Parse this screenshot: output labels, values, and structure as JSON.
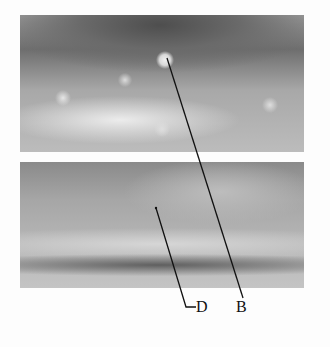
{
  "figure": {
    "type": "technical-manual-illustration",
    "panels": [
      {
        "id": "top",
        "description": "Close-up of wheel rim / drum interior showing bolts; point B at center fastener hole"
      },
      {
        "id": "bottom",
        "description": "Close-up of smooth curved interior surface; point D on surface"
      }
    ],
    "callouts": [
      {
        "label": "D",
        "target_panel": "bottom"
      },
      {
        "label": "B",
        "target_panel": "top"
      }
    ],
    "colors": {
      "background": "#fdfdfd",
      "leader_line": "#111111",
      "label_text": "#111111"
    }
  }
}
